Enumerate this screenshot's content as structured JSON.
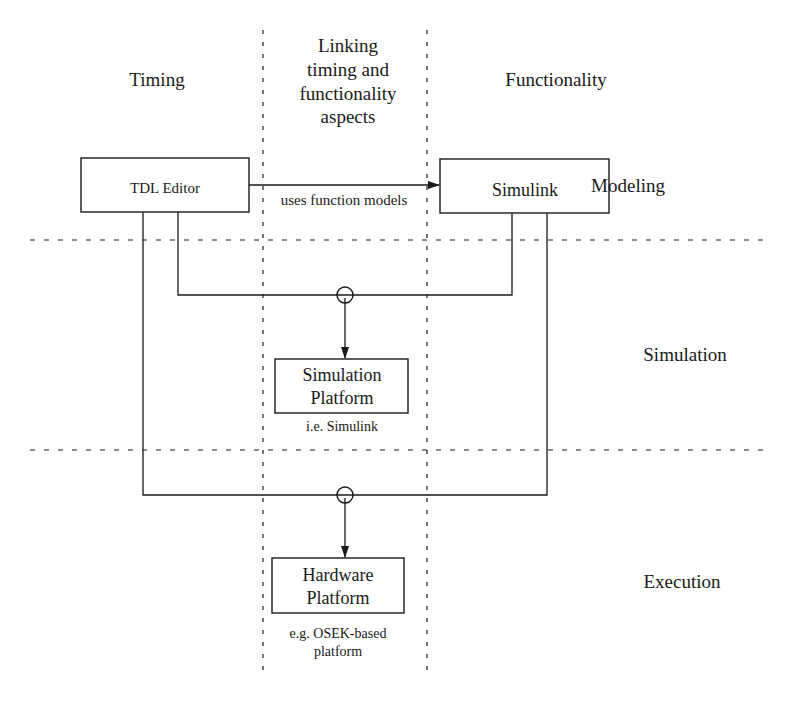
{
  "columns": [
    {
      "id": "timing",
      "label": "Timing"
    },
    {
      "id": "linking",
      "lines": [
        "Linking",
        "timing and",
        "functionality",
        "aspects"
      ]
    },
    {
      "id": "functionality",
      "label": "Functionality"
    }
  ],
  "rows": [
    {
      "id": "modeling",
      "label": "Modeling"
    },
    {
      "id": "simulation",
      "label": "Simulation"
    },
    {
      "id": "execution",
      "label": "Execution"
    }
  ],
  "nodes": {
    "tdl_editor": {
      "label": "TDL Editor"
    },
    "simulink": {
      "label": "Simulink"
    },
    "simulation_platform": {
      "lines": [
        "Simulation",
        "Platform"
      ],
      "note": "i.e. Simulink"
    },
    "hardware_platform": {
      "lines": [
        "Hardware",
        "Platform"
      ],
      "note_lines": [
        "e.g. OSEK-based",
        "platform"
      ]
    }
  },
  "edges": [
    {
      "from": "tdl_editor",
      "to": "simulink",
      "label": "uses function models"
    },
    {
      "from": [
        "tdl_editor",
        "simulink"
      ],
      "to": "simulation_platform",
      "label": ""
    },
    {
      "from": [
        "tdl_editor",
        "simulink"
      ],
      "to": "hardware_platform",
      "label": ""
    }
  ],
  "colors": {
    "line": "#1a1a1a",
    "background": "#ffffff"
  }
}
